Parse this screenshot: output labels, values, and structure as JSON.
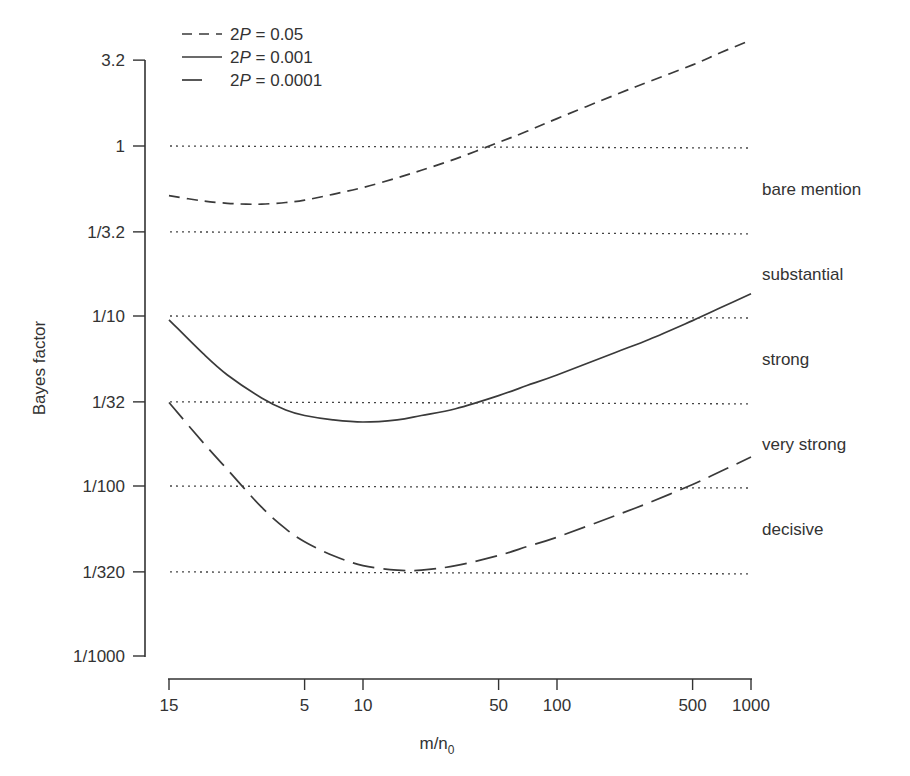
{
  "chart_data": {
    "type": "line",
    "title": "",
    "xlabel": "m/n0",
    "xlabel_main": "m/n",
    "xlabel_sub": "0",
    "ylabel": "Bayes factor",
    "xscale": "log",
    "yscale": "log",
    "xlim": [
      1,
      1000
    ],
    "ylim": [
      0.001,
      3.2
    ],
    "x_ticks": [
      {
        "value": 1,
        "label": "15"
      },
      {
        "value": 5,
        "label": "5"
      },
      {
        "value": 10,
        "label": "10"
      },
      {
        "value": 50,
        "label": "50"
      },
      {
        "value": 100,
        "label": "100"
      },
      {
        "value": 500,
        "label": "500"
      },
      {
        "value": 1000,
        "label": "1000"
      }
    ],
    "y_ticks": [
      {
        "value": 3.2,
        "label": "3.2"
      },
      {
        "value": 1,
        "label": "1"
      },
      {
        "value": 0.3125,
        "label": "1/3.2"
      },
      {
        "value": 0.1,
        "label": "1/10"
      },
      {
        "value": 0.03125,
        "label": "1/32"
      },
      {
        "value": 0.01,
        "label": "1/100"
      },
      {
        "value": 0.003125,
        "label": "1/320"
      },
      {
        "value": 0.001,
        "label": "1/1000"
      }
    ],
    "reference_lines": [
      1,
      0.3125,
      0.1,
      0.03125,
      0.01,
      0.003125
    ],
    "evidence_categories": [
      {
        "label": "bare mention",
        "range": [
          0.3125,
          1
        ]
      },
      {
        "label": "substantial",
        "range": [
          0.1,
          0.3125
        ]
      },
      {
        "label": "strong",
        "range": [
          0.03125,
          0.1
        ]
      },
      {
        "label": "very strong",
        "range": [
          0.01,
          0.03125
        ]
      },
      {
        "label": "decisive",
        "range": [
          0.003125,
          0.01
        ]
      }
    ],
    "legend_position": "top-left",
    "series": [
      {
        "name": "2P = 0.05",
        "legend_prefix": "2",
        "legend_var": "P",
        "legend_value": " = 0.05",
        "style": "short-dash",
        "x": [
          1,
          1.5,
          2,
          2.5,
          3,
          4,
          5,
          7,
          10,
          15,
          20,
          30,
          50,
          70,
          100,
          200,
          300,
          500,
          700,
          1000
        ],
        "values": [
          0.51,
          0.475,
          0.46,
          0.455,
          0.455,
          0.465,
          0.48,
          0.52,
          0.57,
          0.65,
          0.72,
          0.84,
          1.05,
          1.22,
          1.45,
          2.0,
          2.4,
          3.0,
          3.55,
          4.2
        ]
      },
      {
        "name": "2P = 0.001",
        "legend_prefix": "2",
        "legend_var": "P",
        "legend_value": " = 0.001",
        "style": "solid",
        "x": [
          1,
          1.5,
          2,
          3,
          4,
          5,
          7,
          10,
          15,
          20,
          30,
          50,
          70,
          100,
          200,
          300,
          500,
          700,
          1000
        ],
        "values": [
          0.095,
          0.06,
          0.045,
          0.033,
          0.028,
          0.026,
          0.0245,
          0.0238,
          0.0245,
          0.026,
          0.0285,
          0.034,
          0.039,
          0.045,
          0.061,
          0.073,
          0.094,
          0.112,
          0.135
        ]
      },
      {
        "name": "2P = 0.0001",
        "legend_prefix": "2",
        "legend_var": "P",
        "legend_value": " = 0.0001",
        "style": "long-dash",
        "x": [
          1,
          1.5,
          2,
          3,
          4,
          5,
          7,
          10,
          15,
          20,
          30,
          50,
          70,
          100,
          200,
          300,
          500,
          700,
          1000
        ],
        "values": [
          0.031,
          0.018,
          0.0125,
          0.0075,
          0.0056,
          0.0047,
          0.0039,
          0.0034,
          0.0032,
          0.0032,
          0.0034,
          0.0039,
          0.0044,
          0.005,
          0.0067,
          0.008,
          0.0102,
          0.0122,
          0.0148
        ]
      }
    ]
  }
}
